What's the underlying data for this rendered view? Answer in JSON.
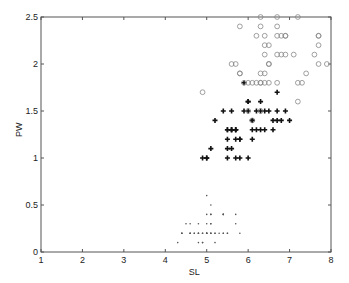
{
  "chart_data": {
    "type": "scatter",
    "title": "",
    "xlabel": "SL",
    "ylabel": "PW",
    "xlim": [
      1,
      8
    ],
    "ylim": [
      0,
      2.5
    ],
    "xticks": [
      1,
      2,
      3,
      4,
      5,
      6,
      7,
      8
    ],
    "yticks": [
      0,
      0.5,
      1,
      1.5,
      2,
      2.5
    ],
    "xtick_labels": [
      "1",
      "2",
      "3",
      "4",
      "5",
      "6",
      "7",
      "8"
    ],
    "ytick_labels": [
      "0",
      "0.5",
      "1",
      "1.5",
      "2",
      "2.5"
    ],
    "grid": false,
    "legend": null,
    "series": [
      {
        "name": "setosa",
        "marker": "dot",
        "color": "#555555",
        "points": [
          [
            5.1,
            0.2
          ],
          [
            4.9,
            0.2
          ],
          [
            4.7,
            0.2
          ],
          [
            4.6,
            0.2
          ],
          [
            5.0,
            0.2
          ],
          [
            5.4,
            0.4
          ],
          [
            4.6,
            0.3
          ],
          [
            5.0,
            0.2
          ],
          [
            4.4,
            0.2
          ],
          [
            4.9,
            0.1
          ],
          [
            5.4,
            0.2
          ],
          [
            4.8,
            0.2
          ],
          [
            4.8,
            0.1
          ],
          [
            4.3,
            0.1
          ],
          [
            5.8,
            0.2
          ],
          [
            5.7,
            0.4
          ],
          [
            5.4,
            0.4
          ],
          [
            5.1,
            0.3
          ],
          [
            5.7,
            0.3
          ],
          [
            5.1,
            0.3
          ],
          [
            5.4,
            0.2
          ],
          [
            5.1,
            0.4
          ],
          [
            4.6,
            0.2
          ],
          [
            5.1,
            0.5
          ],
          [
            4.8,
            0.2
          ],
          [
            5.0,
            0.2
          ],
          [
            5.0,
            0.4
          ],
          [
            5.2,
            0.2
          ],
          [
            5.2,
            0.2
          ],
          [
            4.7,
            0.2
          ],
          [
            4.8,
            0.2
          ],
          [
            5.4,
            0.4
          ],
          [
            5.2,
            0.1
          ],
          [
            5.5,
            0.2
          ],
          [
            4.9,
            0.2
          ],
          [
            5.0,
            0.2
          ],
          [
            5.5,
            0.2
          ],
          [
            4.9,
            0.1
          ],
          [
            4.4,
            0.2
          ],
          [
            5.1,
            0.2
          ],
          [
            5.0,
            0.3
          ],
          [
            4.5,
            0.3
          ],
          [
            4.4,
            0.2
          ],
          [
            5.0,
            0.6
          ],
          [
            5.1,
            0.4
          ],
          [
            4.8,
            0.3
          ],
          [
            5.1,
            0.2
          ],
          [
            4.6,
            0.2
          ],
          [
            5.3,
            0.2
          ],
          [
            5.0,
            0.2
          ]
        ]
      },
      {
        "name": "versicolor",
        "marker": "plus",
        "color": "#111111",
        "points": [
          [
            7.0,
            1.4
          ],
          [
            6.4,
            1.5
          ],
          [
            6.9,
            1.5
          ],
          [
            5.5,
            1.3
          ],
          [
            6.5,
            1.5
          ],
          [
            5.7,
            1.3
          ],
          [
            6.3,
            1.6
          ],
          [
            4.9,
            1.0
          ],
          [
            6.6,
            1.3
          ],
          [
            5.2,
            1.4
          ],
          [
            5.0,
            1.0
          ],
          [
            5.9,
            1.5
          ],
          [
            6.0,
            1.0
          ],
          [
            6.1,
            1.4
          ],
          [
            5.6,
            1.3
          ],
          [
            6.7,
            1.4
          ],
          [
            5.6,
            1.5
          ],
          [
            5.8,
            1.0
          ],
          [
            6.2,
            1.5
          ],
          [
            5.6,
            1.1
          ],
          [
            5.9,
            1.8
          ],
          [
            6.1,
            1.3
          ],
          [
            6.3,
            1.5
          ],
          [
            6.1,
            1.2
          ],
          [
            6.4,
            1.3
          ],
          [
            6.6,
            1.4
          ],
          [
            6.8,
            1.4
          ],
          [
            6.7,
            1.7
          ],
          [
            6.0,
            1.5
          ],
          [
            5.7,
            1.0
          ],
          [
            5.5,
            1.1
          ],
          [
            5.5,
            1.0
          ],
          [
            5.8,
            1.2
          ],
          [
            6.0,
            1.6
          ],
          [
            5.4,
            1.5
          ],
          [
            6.0,
            1.6
          ],
          [
            6.7,
            1.5
          ],
          [
            6.3,
            1.3
          ],
          [
            5.6,
            1.3
          ],
          [
            5.5,
            1.3
          ],
          [
            5.5,
            1.2
          ],
          [
            6.1,
            1.4
          ],
          [
            5.8,
            1.2
          ],
          [
            5.0,
            1.0
          ],
          [
            5.6,
            1.3
          ],
          [
            5.7,
            1.2
          ],
          [
            5.7,
            1.3
          ],
          [
            6.2,
            1.3
          ],
          [
            5.1,
            1.1
          ],
          [
            5.7,
            1.3
          ]
        ]
      },
      {
        "name": "virginica",
        "marker": "circle",
        "color": "#888888",
        "points": [
          [
            6.3,
            2.5
          ],
          [
            5.8,
            1.9
          ],
          [
            7.1,
            2.1
          ],
          [
            6.3,
            1.8
          ],
          [
            6.5,
            2.2
          ],
          [
            7.6,
            2.1
          ],
          [
            4.9,
            1.7
          ],
          [
            7.3,
            1.8
          ],
          [
            6.7,
            1.8
          ],
          [
            7.2,
            2.5
          ],
          [
            6.5,
            2.0
          ],
          [
            6.4,
            1.9
          ],
          [
            6.8,
            2.1
          ],
          [
            5.7,
            2.0
          ],
          [
            5.8,
            2.4
          ],
          [
            6.4,
            2.3
          ],
          [
            6.5,
            1.8
          ],
          [
            7.7,
            2.2
          ],
          [
            7.7,
            2.3
          ],
          [
            6.0,
            1.5
          ],
          [
            6.9,
            2.3
          ],
          [
            5.6,
            2.0
          ],
          [
            7.7,
            2.0
          ],
          [
            6.3,
            1.8
          ],
          [
            6.7,
            2.1
          ],
          [
            7.2,
            1.8
          ],
          [
            6.2,
            1.8
          ],
          [
            6.1,
            1.8
          ],
          [
            6.4,
            2.1
          ],
          [
            7.2,
            1.6
          ],
          [
            7.4,
            1.9
          ],
          [
            7.9,
            2.0
          ],
          [
            6.4,
            2.2
          ],
          [
            6.3,
            1.5
          ],
          [
            6.1,
            1.4
          ],
          [
            7.7,
            2.3
          ],
          [
            6.3,
            2.4
          ],
          [
            6.4,
            1.8
          ],
          [
            6.0,
            1.8
          ],
          [
            6.9,
            2.1
          ],
          [
            6.7,
            2.4
          ],
          [
            6.9,
            2.3
          ],
          [
            5.8,
            1.9
          ],
          [
            6.8,
            2.3
          ],
          [
            6.7,
            2.5
          ],
          [
            6.7,
            2.3
          ],
          [
            6.3,
            1.9
          ],
          [
            6.5,
            2.0
          ],
          [
            6.2,
            2.3
          ],
          [
            5.9,
            1.8
          ]
        ]
      }
    ]
  },
  "plot_area": {
    "left": 41,
    "top": 17,
    "right": 331,
    "bottom": 252
  },
  "colors": {
    "axis": "#555555",
    "background": "#ffffff"
  }
}
